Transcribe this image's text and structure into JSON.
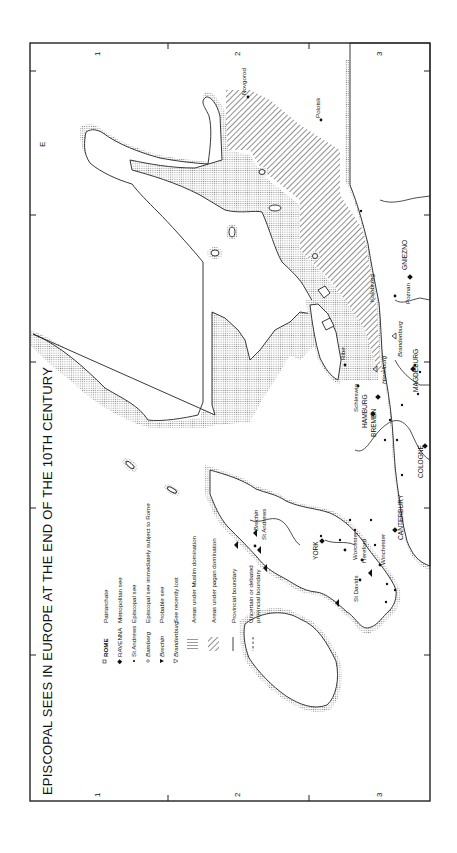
{
  "map": {
    "title": "EPISCOPAL SEES IN EUROPE AT THE END OF THE 10TH CENTURY",
    "orientation": "rotated 90 degrees clockwise",
    "grid": {
      "top_numbers": [
        "1",
        "2",
        "3"
      ],
      "bottom_numbers": [
        "1",
        "2",
        "3"
      ],
      "side_letters": [
        "E"
      ]
    },
    "legend": [
      {
        "symbol": "square-outline",
        "sample": "ROME",
        "label": "Patriarchate"
      },
      {
        "symbol": "diamond-filled",
        "sample": "RAVENNA",
        "label": "Metropolitan see"
      },
      {
        "symbol": "dot",
        "sample": "St Andrews",
        "label": "Episcopal see"
      },
      {
        "symbol": "circle-outline",
        "sample": "Bamberg",
        "label": "Episcopal see immediately subject to Rome"
      },
      {
        "symbol": "triangle-filled",
        "sample": "Brechin",
        "label": "Probable see"
      },
      {
        "symbol": "triangle-outline",
        "sample": "Brandenburg",
        "label": "See recently lost"
      },
      {
        "symbol": "vertical-hatch",
        "sample": "",
        "label": "Areas under Muslim domination"
      },
      {
        "symbol": "diagonal-hatch",
        "sample": "",
        "label": "Areas under pagan domination"
      },
      {
        "symbol": "solid-line",
        "sample": "",
        "label": "Provincial boundary"
      },
      {
        "symbol": "dashed-line",
        "sample": "",
        "label": "Uncertain or debated provincial boundary"
      }
    ],
    "places": {
      "metropolitan": [
        "YORK",
        "CANTERBURY",
        "HAMBURG",
        "BREMEN",
        "COLOGNE",
        "MAGDEBURG",
        "GNIEZNO"
      ],
      "episcopal": [
        "St Andrews",
        "St Davids",
        "Worcester",
        "Hereford",
        "Winchester",
        "Ribe",
        "Schleswig",
        "Poznan",
        "Kolobrzeg",
        "Novgorod",
        "Polotsk"
      ],
      "probable": [
        "Brechin"
      ],
      "recently_lost": [
        "Brandenburg",
        "Havelburg"
      ]
    }
  }
}
